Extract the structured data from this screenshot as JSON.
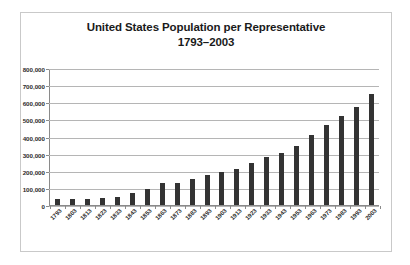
{
  "chart_data": {
    "type": "bar",
    "title": "United States Population per Representative 1793–2003",
    "title_line1": "United States Population per Representative",
    "title_line2": "1793–2003",
    "xlabel": "",
    "ylabel": "",
    "ylim": [
      0,
      800000
    ],
    "ytick_labels": [
      "800,000",
      "700,000",
      "600,000",
      "500,000",
      "400,000",
      "300,000",
      "200,000",
      "100,000",
      "0"
    ],
    "ytick_values": [
      800000,
      700000,
      600000,
      500000,
      400000,
      300000,
      200000,
      100000,
      0
    ],
    "grid": true,
    "legend": false,
    "bar_color": "#333333",
    "categories": [
      "1793",
      "1803",
      "1813",
      "1823",
      "1833",
      "1843",
      "1853",
      "1863",
      "1873",
      "1883",
      "1893",
      "1903",
      "1913",
      "1923",
      "1933",
      "1943",
      "1953",
      "1963",
      "1973",
      "1983",
      "1993",
      "2003"
    ],
    "values": [
      34000,
      34000,
      35000,
      42000,
      48000,
      71000,
      93000,
      127000,
      131000,
      152000,
      174000,
      194000,
      212000,
      243000,
      280000,
      301000,
      345000,
      410000,
      470000,
      519000,
      572000,
      646000
    ],
    "series": [
      {
        "name": "Population per Representative",
        "values": [
          34000,
          34000,
          35000,
          42000,
          48000,
          71000,
          93000,
          127000,
          131000,
          152000,
          174000,
          194000,
          212000,
          243000,
          280000,
          301000,
          345000,
          410000,
          470000,
          519000,
          572000,
          646000
        ]
      }
    ]
  }
}
